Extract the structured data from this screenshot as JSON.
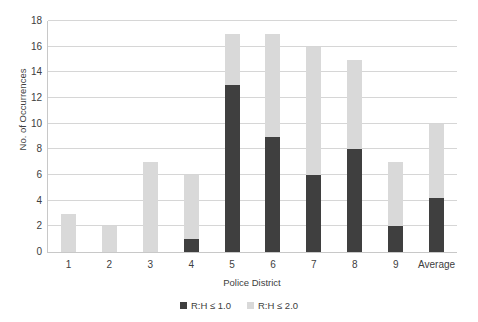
{
  "chart_data": {
    "type": "bar",
    "title": "",
    "subtitle": "",
    "xlabel": "Police District",
    "ylabel": "No. of Occurrences",
    "categories": [
      "1",
      "2",
      "3",
      "4",
      "5",
      "6",
      "7",
      "8",
      "9",
      "Average"
    ],
    "series": [
      {
        "name": "R:H ≤ 1.0",
        "color": "#3f3f3f",
        "values": [
          0,
          0,
          0,
          1,
          13,
          9,
          6,
          8,
          2,
          4.2
        ]
      },
      {
        "name": "R:H ≤ 2.0",
        "color": "#d9d9d9",
        "values": [
          3,
          2,
          7,
          5,
          4,
          8,
          10,
          7,
          5,
          5.8
        ]
      }
    ],
    "totals": [
      3,
      2,
      7,
      6,
      17,
      17,
      16,
      15,
      7,
      10
    ],
    "stacked": true,
    "ylim": [
      0,
      18
    ],
    "ytick_labels": [
      "0",
      "2",
      "4",
      "6",
      "8",
      "10",
      "12",
      "14",
      "16",
      "18"
    ],
    "ytick_values": [
      0,
      2,
      4,
      6,
      8,
      10,
      12,
      14,
      16,
      18
    ],
    "grid": "horizontal",
    "legend_position": "bottom",
    "annotations": []
  }
}
